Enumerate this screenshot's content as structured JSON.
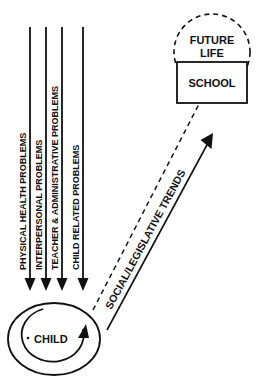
{
  "diagram": {
    "colors": {
      "stroke": "#111111",
      "background": "#ffffff",
      "text": "#111111"
    },
    "nodes": {
      "future_life": {
        "label_line1": "FUTURE",
        "label_line2": "LIFE",
        "shape": "dashed-circle"
      },
      "school": {
        "label": "SCHOOL",
        "shape": "solid-rectangle"
      },
      "child": {
        "label": "CHILD",
        "shape": "ellipse"
      }
    },
    "streams": [
      {
        "label": "PHYSICAL HEALTH PROBLEMS",
        "arrow": "down-arrow"
      },
      {
        "label": "INTERPERSONAL PROBLEMS",
        "arrow": "down-arrow"
      },
      {
        "label": "TEACHER & ADMINISTRATIVE PROBLEMS",
        "arrow": "down-arrow"
      },
      {
        "label": "CHILD RELATED PROBLEMS",
        "arrow": "down-arrow"
      }
    ],
    "connectors": {
      "trend_arrow": {
        "label": "SOCIAL/LEGISLATIVE TRENDS",
        "style": "solid",
        "arrow": "up-right-arrow"
      },
      "future_link": {
        "style": "dashed",
        "arrow": "none"
      },
      "child_feedback": {
        "style": "solid-arc",
        "arrow": "curved-up-arrow"
      }
    }
  }
}
